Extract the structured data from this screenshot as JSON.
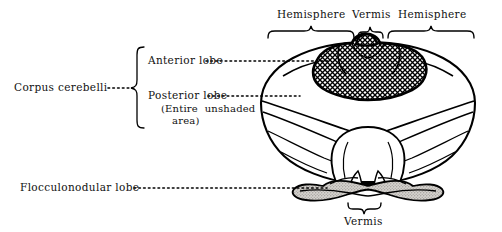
{
  "figure": {
    "colors": {
      "outline": "#000000",
      "hatch_fill": "#ffffff",
      "hatch_line": "#000000",
      "stipple_fill": "#c9c6c2",
      "leader": "#000000",
      "background": "#ffffff"
    }
  },
  "labels": {
    "corpus_cerebelli": "Corpus cerebelli",
    "anterior_lobe": "Anterior lobe",
    "posterior_lobe": "Posterior lobe",
    "posterior_lobe_note_line1": "(Entire  unshaded",
    "posterior_lobe_note_line2": "area)",
    "flocculonodular_lobe": "Flocculonodular lobe",
    "hemisphere_left": "Hemisphere",
    "vermis_top": "Vermis",
    "hemisphere_right": "Hemisphere",
    "vermis_bottom": "Vermis"
  },
  "leaders": {
    "corpus_cerebelli_dots": "·······",
    "anterior_lobe_dots": "··························",
    "posterior_lobe_dots": "···················",
    "flocculonodular_dots": "·················································"
  },
  "braces": {
    "corpus_cerebelli_brace": "left-curly-brace",
    "hemisphere_left_brace": "top-curly-brace",
    "vermis_top_brace": "top-curly-brace",
    "hemisphere_right_brace": "top-curly-brace",
    "vermis_bottom_brace": "bottom-curly-brace"
  },
  "regions": {
    "anterior_lobe_shading": "cross-hatched",
    "posterior_lobe_shading": "unshaded",
    "flocculonodular_lobe_shading": "stippled-gray"
  }
}
